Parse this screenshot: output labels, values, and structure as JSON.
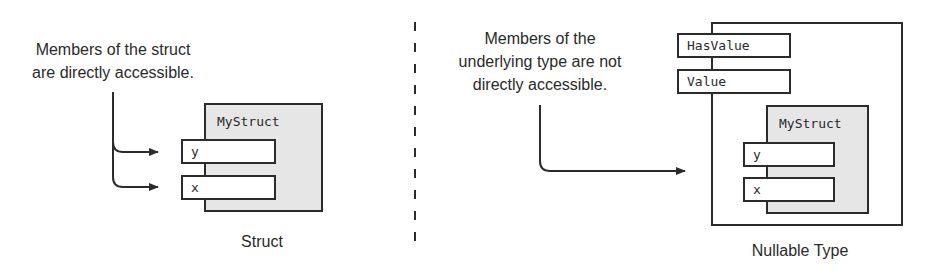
{
  "left_panel": {
    "caption_lines": [
      "Members of the struct",
      "are directly accessible."
    ],
    "struct_name": "MyStruct",
    "fields": [
      "y",
      "x"
    ],
    "footer_label": "Struct"
  },
  "right_panel": {
    "caption_lines": [
      "Members of the",
      "underlying type are not",
      "directly accessible."
    ],
    "wrapper_fields": [
      "HasValue",
      "Value"
    ],
    "struct_name": "MyStruct",
    "fields": [
      "y",
      "x"
    ],
    "footer_label": "Nullable Type"
  },
  "colors": {
    "struct_fill": "#e6e6e6",
    "stroke": "#2b2b2b",
    "background": "#ffffff"
  }
}
